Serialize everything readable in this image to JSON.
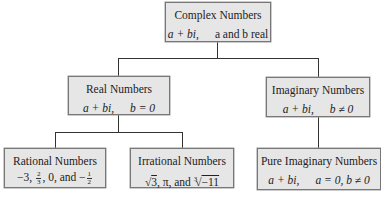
{
  "diagram": {
    "type": "tree",
    "nodes": {
      "complex": {
        "title": "Complex Numbers",
        "formula_left": "a + bi,",
        "formula_right": "a and b real"
      },
      "real": {
        "title": "Real Numbers",
        "formula_left": "a + bi,",
        "formula_right": "b = 0"
      },
      "imaginary": {
        "title": "Imaginary Numbers",
        "formula_left": "a + bi,",
        "formula_right": "b ≠ 0"
      },
      "rational": {
        "title": "Rational Numbers",
        "examples": {
          "first": "−3,",
          "frac1_num": "2",
          "frac1_den": "3",
          "mid": ", 0, and −",
          "frac2_num": "1",
          "frac2_den": "2"
        }
      },
      "irrational": {
        "title": "Irrational Numbers",
        "examples": {
          "sqrt_sign": "√",
          "sqrt_val": "3",
          "mid": ", π, and ",
          "cbrt_index": "3",
          "cbrt_sign": "√",
          "cbrt_val": "−11"
        }
      },
      "pure_imaginary": {
        "title": "Pure Imaginary Numbers",
        "formula_left": "a + bi,",
        "formula_right": "a = 0, b ≠ 0"
      }
    },
    "edges": [
      [
        "complex",
        "real"
      ],
      [
        "complex",
        "imaginary"
      ],
      [
        "real",
        "rational"
      ],
      [
        "real",
        "irrational"
      ],
      [
        "imaginary",
        "pure_imaginary"
      ]
    ],
    "colors": {
      "box_fill": "#e6e6e6",
      "box_border": "#777777",
      "connector": "#333333"
    }
  }
}
